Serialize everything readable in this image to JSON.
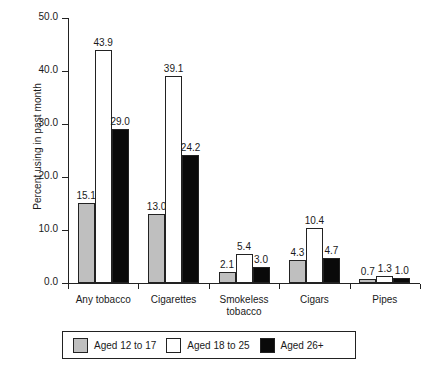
{
  "chart_data": {
    "type": "bar",
    "title": "",
    "xlabel": "",
    "ylabel": "Percent using in past month",
    "ylim": [
      0,
      50
    ],
    "yticks": [
      "0.0",
      "10.0",
      "20.0",
      "30.0",
      "40.0",
      "50.0"
    ],
    "ytick_values": [
      0,
      10,
      20,
      30,
      40,
      50
    ],
    "grid": false,
    "legend_position": "bottom",
    "categories": [
      "Any tobacco",
      "Cigarettes",
      "Smokeless\ntobacco",
      "Cigars",
      "Pipes"
    ],
    "series": [
      {
        "name": "Aged 12 to 17",
        "color": "#bfbfbf",
        "values": [
          15.1,
          13.0,
          2.1,
          4.3,
          0.7
        ],
        "labels": [
          "15.1",
          "13.0",
          "2.1",
          "4.3",
          "0.7"
        ]
      },
      {
        "name": "Aged 18 to 25",
        "color": "#ffffff",
        "values": [
          43.9,
          39.1,
          5.4,
          10.4,
          1.3
        ],
        "labels": [
          "43.9",
          "39.1",
          "5.4",
          "10.4",
          "1.3"
        ]
      },
      {
        "name": "Aged 26+",
        "color": "#0a0a0a",
        "values": [
          29.0,
          24.2,
          3.0,
          4.7,
          1.0
        ],
        "labels": [
          "29.0",
          "24.2",
          "3.0",
          "4.7",
          "1.0"
        ]
      }
    ]
  },
  "legend": {
    "items": [
      {
        "label": "Aged 12 to 17",
        "swatch": "gray"
      },
      {
        "label": "Aged 18 to 25",
        "swatch": "white"
      },
      {
        "label": "Aged 26+",
        "swatch": "black"
      }
    ]
  }
}
